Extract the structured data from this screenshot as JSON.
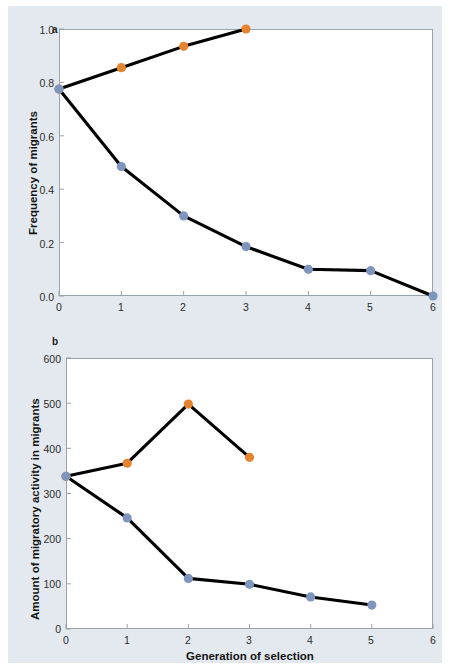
{
  "figure": {
    "background_color": "#e4e9ef",
    "plot_background_color": "#ffffff",
    "frame_color": "#9aa3ad",
    "line_color": "#000000",
    "series_colors": {
      "up_selected": "#e5842f",
      "down_selected": "#7e96bd"
    }
  },
  "panels": [
    {
      "letter": "a",
      "chart_data": {
        "type": "line",
        "title": "",
        "xlabel": "",
        "ylabel": "Frequency of migrants",
        "xlim": [
          0,
          6
        ],
        "ylim": [
          0,
          1.0
        ],
        "xticks": [
          "0",
          "1",
          "2",
          "3",
          "4",
          "5",
          "6"
        ],
        "yticks": [
          "0.0",
          "0.2",
          "0.4",
          "0.6",
          "0.8",
          "1.0"
        ],
        "grid": false,
        "legend": "none",
        "series": [
          {
            "name": "up-selected line",
            "color": "#e5842f",
            "x": [
              0,
              1,
              2,
              3
            ],
            "values": [
              0.775,
              0.855,
              0.935,
              1.0
            ]
          },
          {
            "name": "down-selected line",
            "color": "#7e96bd",
            "x": [
              0,
              1,
              2,
              3,
              4,
              5,
              6
            ],
            "values": [
              0.775,
              0.485,
              0.3,
              0.185,
              0.1,
              0.095,
              0.0
            ]
          }
        ]
      }
    },
    {
      "letter": "b",
      "chart_data": {
        "type": "line",
        "title": "",
        "xlabel": "Generation of selection",
        "ylabel": "Amount of migratory activity in migrants",
        "xlim": [
          0,
          6
        ],
        "ylim": [
          0,
          600
        ],
        "xticks": [
          "0",
          "1",
          "2",
          "3",
          "4",
          "5",
          "6"
        ],
        "yticks": [
          "0",
          "100",
          "200",
          "300",
          "400",
          "500",
          "600"
        ],
        "grid": false,
        "legend": "none",
        "series": [
          {
            "name": "up-selected line",
            "color": "#e5842f",
            "x": [
              0,
              1,
              2,
              3
            ],
            "values": [
              338,
              367,
              498,
              380
            ]
          },
          {
            "name": "down-selected line",
            "color": "#7e96bd",
            "x": [
              0,
              1,
              2,
              3,
              4,
              5
            ],
            "values": [
              338,
              246,
              112,
              99,
              71,
              53
            ]
          }
        ]
      }
    }
  ]
}
